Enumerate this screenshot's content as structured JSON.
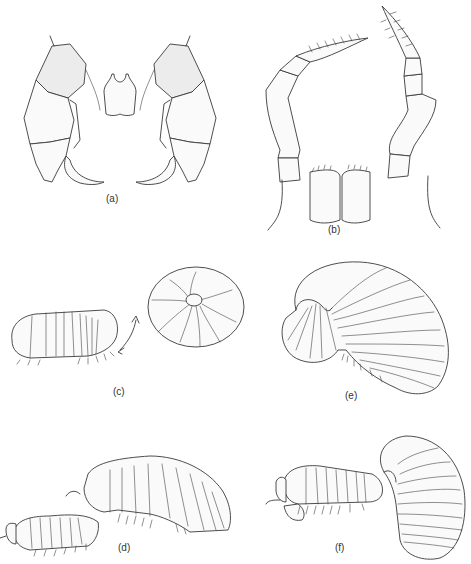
{
  "figure": {
    "panels": [
      {
        "id": "a",
        "label": "(a)",
        "description": "paired claw-like appendages (gnathopods) with central small bilobed structure"
      },
      {
        "id": "b",
        "label": "(b)",
        "description": "pair of segmented antennae with setae above mouthparts"
      },
      {
        "id": "c",
        "label": "(c)",
        "description": "isopod in lateral view with arrow to fully conglobated (rolled) ball"
      },
      {
        "id": "d",
        "label": "(d)",
        "description": "two individuals, larger one over smaller, lateral view"
      },
      {
        "id": "e",
        "label": "(e)",
        "description": "isopod partially rolled, lateral view"
      },
      {
        "id": "f",
        "label": "(f)",
        "description": "two individuals, one rolled into upright curved posture"
      }
    ]
  }
}
